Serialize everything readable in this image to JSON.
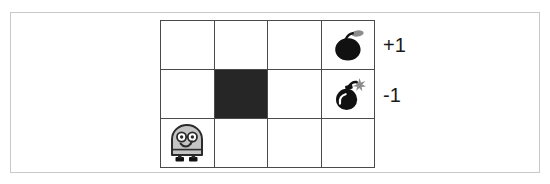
{
  "figure": {
    "name": "gridworld-diagram",
    "width": 550,
    "height": 184,
    "background_color": "#ffffff",
    "frame_color": "#c9c9c9"
  },
  "grid": {
    "columns": 4,
    "rows": 3,
    "line_color": "#4a4a4a",
    "cell_background": "#ffffff",
    "wall_color": "#262626",
    "cells": [
      {
        "row": 1,
        "col": 1,
        "type": "empty",
        "icon": ""
      },
      {
        "row": 1,
        "col": 2,
        "type": "empty",
        "icon": ""
      },
      {
        "row": 1,
        "col": 3,
        "type": "empty",
        "icon": ""
      },
      {
        "row": 1,
        "col": 4,
        "type": "reward",
        "icon": "apple-bomb-icon"
      },
      {
        "row": 2,
        "col": 1,
        "type": "empty",
        "icon": ""
      },
      {
        "row": 2,
        "col": 2,
        "type": "wall",
        "icon": ""
      },
      {
        "row": 2,
        "col": 3,
        "type": "empty",
        "icon": ""
      },
      {
        "row": 2,
        "col": 4,
        "type": "penalty",
        "icon": "lit-bomb-icon"
      },
      {
        "row": 3,
        "col": 1,
        "type": "agent",
        "icon": "robot-agent-icon"
      },
      {
        "row": 3,
        "col": 2,
        "type": "empty",
        "icon": ""
      },
      {
        "row": 3,
        "col": 3,
        "type": "empty",
        "icon": ""
      },
      {
        "row": 3,
        "col": 4,
        "type": "empty",
        "icon": ""
      }
    ]
  },
  "labels": {
    "positive_reward": "+1",
    "negative_reward": "-1",
    "text_color": "#1a1a1a"
  },
  "icons": {
    "apple_bomb": {
      "name": "apple-bomb-icon",
      "body_color": "#111111",
      "stem_color": "#111111",
      "leaf_color": "#8c8c8c"
    },
    "lit_bomb": {
      "name": "lit-bomb-icon",
      "body_color": "#111111",
      "fuse_color": "#111111",
      "spark_color": "#8c8c8c"
    },
    "robot_agent": {
      "name": "robot-agent-icon",
      "body_color": "#c4c4c4",
      "outline_color": "#2b2b2b",
      "eye_color": "#ffffff",
      "foot_color": "#111111"
    }
  }
}
